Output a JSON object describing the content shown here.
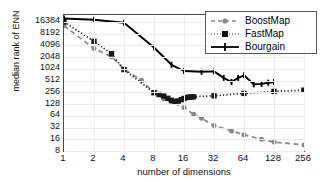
{
  "chart_data": {
    "type": "line",
    "title": "",
    "xlabel": "number of dimensions",
    "ylabel": "median rank of ENN",
    "xscale": "log2",
    "yscale": "log2",
    "xlim": [
      1,
      256
    ],
    "ylim": [
      8,
      24576
    ],
    "xticks": [
      "1",
      "2",
      "4",
      "8",
      "16",
      "32",
      "64",
      "128",
      "256"
    ],
    "xtickvalues": [
      1,
      2,
      4,
      8,
      16,
      32,
      64,
      128,
      256
    ],
    "yticks": [
      "16384",
      "8192",
      "4096",
      "2048",
      "1024",
      "512",
      "256",
      "128",
      "64",
      "32",
      "16",
      "8"
    ],
    "ytickvalues": [
      16384,
      8192,
      4096,
      2048,
      1024,
      512,
      256,
      128,
      64,
      32,
      16,
      8
    ],
    "grid": true,
    "legend_position": "top-right",
    "series": [
      {
        "name": "BoostMap",
        "color": "#888888",
        "linestyle": "dashed",
        "marker": "circle",
        "x": [
          1,
          2,
          3,
          4,
          6,
          8,
          10,
          12,
          16,
          20,
          24,
          32,
          48,
          64,
          96,
          128,
          256
        ],
        "y": [
          13000,
          3400,
          2100,
          1000,
          520,
          250,
          175,
          140,
          105,
          70,
          55,
          36,
          26,
          21,
          16,
          13.5,
          11.5
        ]
      },
      {
        "name": "FastMap",
        "color": "#1a1a1a",
        "linestyle": "dotted",
        "marker": "square",
        "x": [
          1,
          2,
          3,
          4,
          8,
          9,
          10,
          11,
          12,
          13,
          14,
          15,
          16,
          17,
          18,
          19,
          20,
          32,
          64,
          128,
          256
        ],
        "y": [
          16384,
          5200,
          2500,
          980,
          250,
          225,
          205,
          180,
          160,
          150,
          152,
          165,
          178,
          188,
          192,
          195,
          196,
          208,
          240,
          270,
          290
        ]
      },
      {
        "name": "Bourgain",
        "color": "#000000",
        "linestyle": "solid",
        "marker": "plus",
        "x": [
          1,
          2,
          4,
          8,
          12,
          16,
          24,
          32,
          40,
          48,
          56,
          64,
          80,
          96,
          112,
          128
        ],
        "y": [
          20000,
          18500,
          15500,
          3600,
          1300,
          900,
          860,
          880,
          600,
          470,
          600,
          700,
          410,
          420,
          450,
          470
        ]
      }
    ]
  },
  "legend": {
    "entries": [
      {
        "label": "BoostMap"
      },
      {
        "label": "FastMap"
      },
      {
        "label": "Bourgain"
      }
    ]
  }
}
